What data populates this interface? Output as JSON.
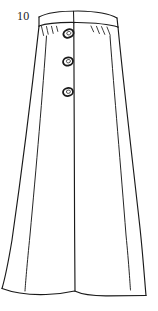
{
  "illustration": {
    "figure_number": "10",
    "title": "Long A-line button-front skirt technical sketch",
    "medium": "hand-drawn line art",
    "background_color": "#ffffff",
    "line_color": "#1a1a1a",
    "garment": {
      "type": "skirt",
      "silhouette": "A-line / full-length flared",
      "closure": "center front button placket",
      "button_count": 3,
      "waistband": "curved fitted waistband with center seam",
      "details": [
        "waist gathers",
        "center front seam",
        "panel seams",
        "wavy hem"
      ]
    },
    "parts": [
      {
        "name": "waistband",
        "label": "Waistband"
      },
      {
        "name": "waistband-center-seam",
        "label": "Waistband center seam"
      },
      {
        "name": "gather-lines-left",
        "label": "Left waist gathers"
      },
      {
        "name": "gather-lines-right",
        "label": "Right waist gathers"
      },
      {
        "name": "button-1",
        "label": "Top button"
      },
      {
        "name": "button-2",
        "label": "Middle button"
      },
      {
        "name": "button-3",
        "label": "Bottom button"
      },
      {
        "name": "center-front-seam",
        "label": "Center front seam"
      },
      {
        "name": "left-side-seam",
        "label": "Left side seam"
      },
      {
        "name": "right-side-seam",
        "label": "Right side seam"
      },
      {
        "name": "left-panel-seam",
        "label": "Left panel seam"
      },
      {
        "name": "right-panel-seam",
        "label": "Right panel seam"
      },
      {
        "name": "hemline",
        "label": "Hemline"
      }
    ]
  }
}
